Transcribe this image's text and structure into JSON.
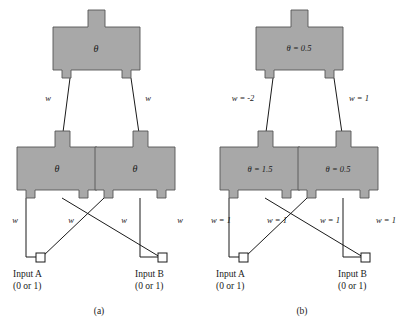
{
  "figure": {
    "colors": {
      "gate_fill": "#a8a8a8",
      "gate_stroke": "#555555",
      "wire": "#1a1a1a",
      "terminal_fill": "#ffffff",
      "background": "#ffffff",
      "text": "#1a1a1a"
    },
    "panels": [
      {
        "id": "a",
        "caption": "(a)",
        "gates": [
          {
            "id": "output",
            "theta": "θ"
          },
          {
            "id": "hidden-left",
            "theta": "θ"
          },
          {
            "id": "hidden-right",
            "theta": "θ"
          }
        ],
        "weights": [
          {
            "id": "w-hidden-left-to-output",
            "label": "w"
          },
          {
            "id": "w-hidden-right-to-output",
            "label": "w"
          },
          {
            "id": "w-inputA-to-hidden-left",
            "label": "w"
          },
          {
            "id": "w-inputA-to-hidden-right",
            "label": "w"
          },
          {
            "id": "w-inputB-to-hidden-left",
            "label": "w"
          },
          {
            "id": "w-inputB-to-hidden-right",
            "label": "w"
          }
        ],
        "inputs": [
          {
            "id": "input-a",
            "name": "Input A",
            "range": "(0 or 1)"
          },
          {
            "id": "input-b",
            "name": "Input B",
            "range": "(0 or 1)"
          }
        ]
      },
      {
        "id": "b",
        "caption": "(b)",
        "gates": [
          {
            "id": "output",
            "theta": "θ = 0.5"
          },
          {
            "id": "hidden-left",
            "theta": "θ = 1.5"
          },
          {
            "id": "hidden-right",
            "theta": "θ = 0.5"
          }
        ],
        "weights": [
          {
            "id": "w-hidden-left-to-output",
            "label": "w = -2"
          },
          {
            "id": "w-hidden-right-to-output",
            "label": "w = 1"
          },
          {
            "id": "w-inputA-to-hidden-left",
            "label": "w = 1"
          },
          {
            "id": "w-inputA-to-hidden-right",
            "label": "w = 1"
          },
          {
            "id": "w-inputB-to-hidden-left",
            "label": "w = 1"
          },
          {
            "id": "w-inputB-to-hidden-right",
            "label": "w = 1"
          }
        ],
        "inputs": [
          {
            "id": "input-a",
            "name": "Input A",
            "range": "(0 or 1)"
          },
          {
            "id": "input-b",
            "name": "Input B",
            "range": "(0 or 1)"
          }
        ]
      }
    ]
  }
}
